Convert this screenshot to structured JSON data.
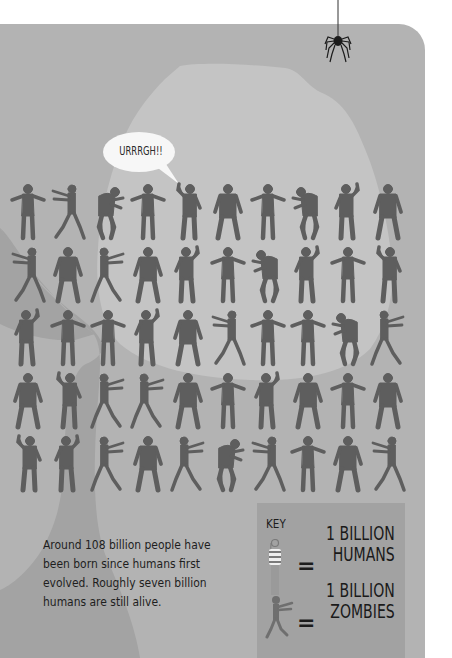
{
  "illustration": {
    "speech_bubble": "URRRGH!!",
    "zombie_grid": {
      "rows": 5,
      "columns": 10,
      "total_zombies": 50
    },
    "description": "Around 108 billion people have been born since humans first evolved. Roughly seven billion humans are still alive."
  },
  "key": {
    "title": "KEY",
    "items": [
      {
        "icon": "human-icon",
        "symbol": "=",
        "line1": "1 BILLION",
        "line2": "HUMANS"
      },
      {
        "icon": "zombie-icon",
        "symbol": "=",
        "line1": "1 BILLION",
        "line2": "ZOMBIES"
      }
    ]
  },
  "colors": {
    "page": "#ffffff",
    "panel": "#b3b3b3",
    "light_blob": "#c4c4c4",
    "dark_shape": "#a3a3a3",
    "silhouette": "#5e5e5e",
    "key_bg": "#a2a2a2",
    "text": "#1e1e1e"
  }
}
